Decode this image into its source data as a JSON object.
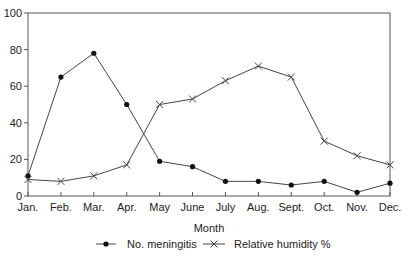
{
  "chart_data": {
    "type": "line",
    "title": "",
    "xlabel": "Month",
    "ylabel": "",
    "ylim": [
      0,
      100
    ],
    "yticks": [
      0,
      20,
      40,
      60,
      80,
      100
    ],
    "grid": false,
    "legend_position": "bottom",
    "categories": [
      "Jan.",
      "Feb.",
      "Mar.",
      "Apr.",
      "May",
      "June",
      "July",
      "Aug.",
      "Sept.",
      "Oct.",
      "Nov.",
      "Dec."
    ],
    "series": [
      {
        "name": "No. meningitis",
        "marker": "dot",
        "values": [
          11,
          65,
          78,
          50,
          19,
          16,
          8,
          8,
          6,
          8,
          2,
          7
        ]
      },
      {
        "name": "Relative humidity %",
        "marker": "x",
        "values": [
          9,
          8,
          11,
          17,
          50,
          53,
          63,
          71,
          65,
          30,
          22,
          17
        ]
      }
    ]
  },
  "colors": {
    "line": "#444444",
    "frame": "#555555",
    "text": "#222222"
  }
}
